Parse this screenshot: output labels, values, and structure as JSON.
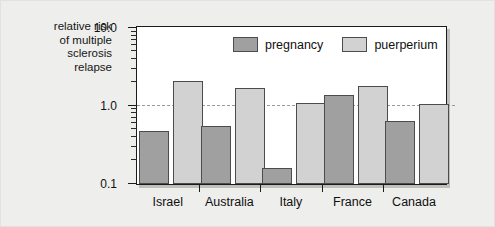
{
  "chart_data": {
    "type": "bar",
    "title": "",
    "ylabel": "relative risk of multiple sclerosis relapse",
    "xlabel": "",
    "yscale": "log",
    "ylim": [
      0.1,
      10.0
    ],
    "ytick_labels": [
      "10.0",
      "1.0",
      "0.1"
    ],
    "ytick_values": [
      10.0,
      1.0,
      0.1
    ],
    "grid": false,
    "reference_line": 1.0,
    "legend_position": "top-center-inside",
    "categories": [
      "Israel",
      "Australia",
      "Italy",
      "France",
      "Canada"
    ],
    "series": [
      {
        "name": "pregnancy",
        "color": "#a0a0a0",
        "values": [
          0.48,
          0.55,
          0.16,
          1.4,
          0.65
        ]
      },
      {
        "name": "puerperium",
        "color": "#d2d2d2",
        "values": [
          2.1,
          1.7,
          1.1,
          1.8,
          1.05
        ]
      }
    ]
  },
  "axis_title": {
    "line1": "relative risk",
    "line2": "of multiple",
    "line3": "sclerosis",
    "line4": "relapse"
  },
  "legend": {
    "items": [
      {
        "label": "pregnancy"
      },
      {
        "label": "puerperium"
      }
    ]
  },
  "colors": {
    "pregnancy": "#a0a0a0",
    "puerperium": "#d2d2d2",
    "background": "#eeeeec",
    "plot_background": "#ffffff",
    "axis": "#1b1b1b",
    "reference_line": "#9a9a9a"
  }
}
